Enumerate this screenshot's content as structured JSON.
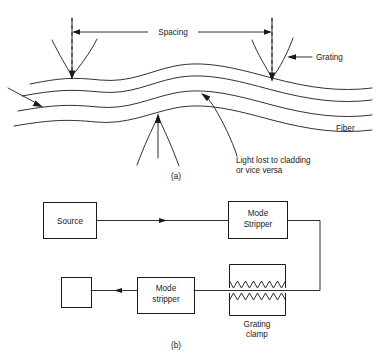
{
  "figure": {
    "ink_color": "#1a1a1a",
    "background_color": "#ffffff",
    "panels": [
      {
        "id": "a",
        "label": "(a)",
        "caption": "Grating coupling into a fiber"
      },
      {
        "id": "b",
        "label": "(b)",
        "caption": "Block diagram of grating clamp setup"
      }
    ]
  },
  "panel_a": {
    "label": "(a)",
    "annotations": {
      "spacing": "Spacing",
      "grating": "Grating",
      "fiber": "Fiber",
      "light_lost_line1": "Light lost to cladding",
      "light_lost_line2": "or vice versa"
    },
    "elements": {
      "fiber_line_count": 4,
      "grating_beam_count": 3,
      "dashed_marker_count": 2,
      "down_arrow_count": 2,
      "up_arrow_count": 1,
      "input_arrow_count": 1
    }
  },
  "panel_b": {
    "label": "(b)",
    "blocks": [
      {
        "name": "source",
        "label_line1": "Source",
        "label_line2": ""
      },
      {
        "name": "mode-stripper-top",
        "label_line1": "Mode",
        "label_line2": "Stripper"
      },
      {
        "name": "detector",
        "label_line1": "",
        "label_line2": ""
      },
      {
        "name": "mode-stripper-bottom",
        "label_line1": "Mode",
        "label_line2": "stripper"
      }
    ],
    "grating_clamp": {
      "label_line1": "Grating",
      "label_line2": "clamp",
      "jaw_count": 2,
      "teeth_per_jaw": 7
    },
    "signal_flow": {
      "arrow_count": 2,
      "direction_top": "left-to-right",
      "direction_bottom": "right-to-left"
    }
  }
}
